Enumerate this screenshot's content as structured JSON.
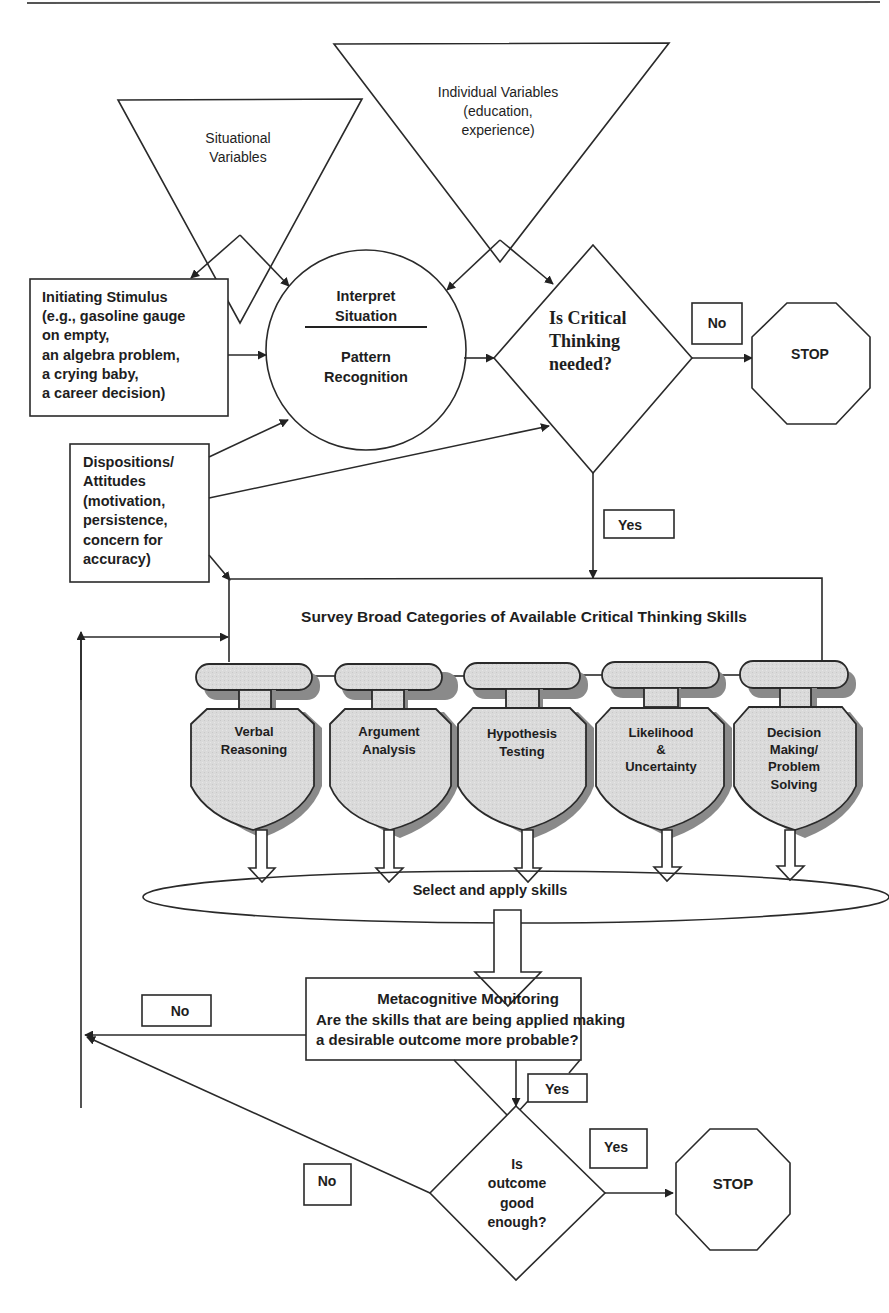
{
  "diagram": {
    "type": "flowchart",
    "inputs": {
      "situational_variables": [
        "Situational",
        "Variables"
      ],
      "individual_variables": [
        "Individual Variables",
        "(education,",
        "experience)"
      ],
      "initiating_stimulus": [
        "Initiating Stimulus",
        "(e.g., gasoline gauge",
        "on empty,",
        "an algebra problem,",
        "a crying baby,",
        "a career decision)"
      ],
      "dispositions": [
        "Dispositions/",
        "Attitudes",
        "(motivation,",
        "persistence,",
        "concern for",
        "accuracy)"
      ]
    },
    "interpret": {
      "top": [
        "Interpret",
        "Situation"
      ],
      "bottom": [
        "Pattern",
        "Recognition"
      ]
    },
    "decision1": {
      "lines": [
        "Is Critical",
        "Thinking",
        "needed?"
      ],
      "no_label": "No",
      "yes_label": "Yes"
    },
    "stop1": "STOP",
    "survey_box": "Survey Broad Categories of Available Critical Thinking Skills",
    "skills": [
      {
        "lines": [
          "Verbal",
          "Reasoning"
        ]
      },
      {
        "lines": [
          "Argument",
          "Analysis"
        ]
      },
      {
        "lines": [
          "Hypothesis",
          "Testing"
        ]
      },
      {
        "lines": [
          "Likelihood",
          "&",
          "Uncertainty"
        ]
      },
      {
        "lines": [
          "Decision",
          "Making/",
          "Problem",
          "Solving"
        ]
      }
    ],
    "select_apply": "Select and apply skills",
    "metacognitive": {
      "title": "Metacognitive Monitoring",
      "line1": "Are the skills that are being applied making",
      "line2": "a desirable outcome more probable?",
      "no_label": "No",
      "yes_label": "Yes"
    },
    "decision2": {
      "lines": [
        "Is",
        "outcome",
        "good",
        "enough?"
      ],
      "no_label": "No",
      "yes_label": "Yes"
    },
    "stop2": "STOP"
  }
}
